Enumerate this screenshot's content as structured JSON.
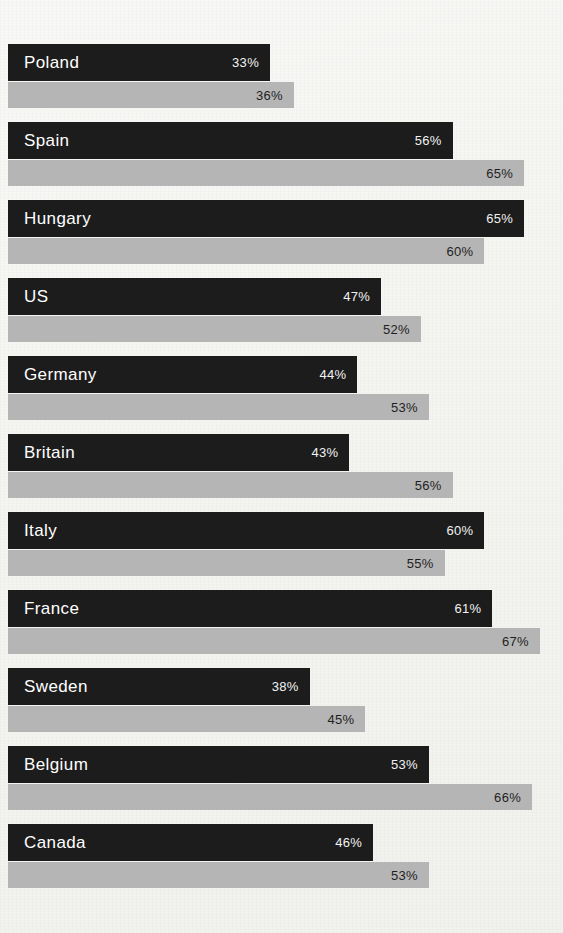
{
  "chart_data": {
    "type": "bar",
    "orientation": "horizontal",
    "title": "",
    "subtitle": "",
    "xlabel": "",
    "ylabel": "",
    "xlim": [
      0,
      70
    ],
    "grid": false,
    "legend": "none",
    "value_suffix": "%",
    "categories": [
      "Poland",
      "Spain",
      "Hungary",
      "US",
      "Germany",
      "Britain",
      "Italy",
      "France",
      "Sweden",
      "Belgium",
      "Canada"
    ],
    "series": [
      {
        "name": "series-dark",
        "color": "#1c1c1c",
        "values": [
          33,
          56,
          65,
          47,
          44,
          43,
          60,
          61,
          38,
          53,
          46
        ],
        "labels": [
          "33%",
          "56%",
          "65%",
          "47%",
          "44%",
          "43%",
          "60%",
          "61%",
          "38%",
          "53%",
          "46%"
        ]
      },
      {
        "name": "series-gray",
        "color": "#b5b5b5",
        "values": [
          36,
          65,
          60,
          52,
          53,
          56,
          55,
          67,
          45,
          66,
          53
        ],
        "labels": [
          "36%",
          "65%",
          "60%",
          "52%",
          "53%",
          "56%",
          "55%",
          "67%",
          "45%",
          "66%",
          "53%"
        ]
      }
    ]
  },
  "colors": {
    "background": "#f6f6f4",
    "bar_dark": "#1c1c1c",
    "bar_gray": "#b5b5b5",
    "label_on_dark": "#ffffff",
    "label_on_gray": "#1f1f1f"
  },
  "geometry": {
    "origin_x": 8,
    "px_per_percent": 7.94,
    "row_pitch": 78,
    "first_row_top": 44,
    "dark_height": 37,
    "gray_height": 26
  }
}
